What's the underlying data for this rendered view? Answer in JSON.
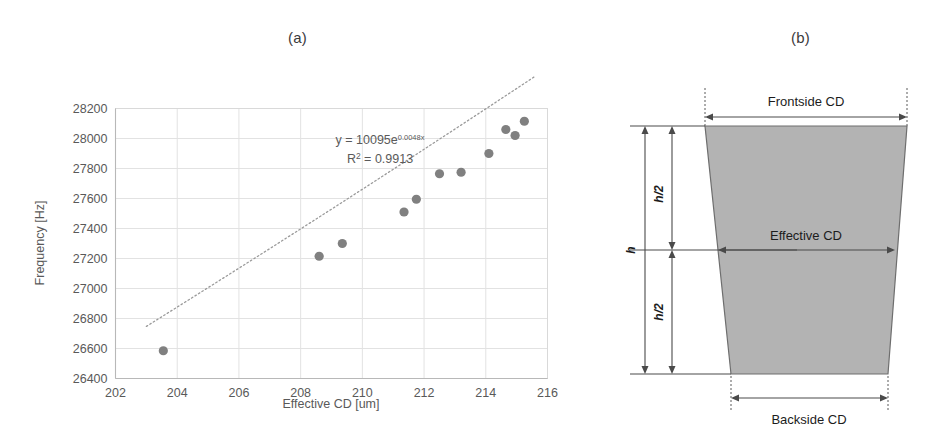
{
  "figure": {
    "panel_a_label": "(a)",
    "panel_b_label": "(b)"
  },
  "chart_data": {
    "type": "scatter",
    "title": "",
    "xlabel": "Effective CD [um]",
    "ylabel": "Frequency [Hz]",
    "xlim": [
      202,
      216
    ],
    "ylim": [
      26400,
      28200
    ],
    "xticks": [
      202,
      204,
      206,
      208,
      210,
      212,
      214,
      216
    ],
    "yticks": [
      26400,
      26600,
      26800,
      27000,
      27200,
      27400,
      27600,
      27800,
      28000,
      28200
    ],
    "grid": true,
    "legend": "none",
    "marker_color": "#808080",
    "trendline": {
      "type": "exponential",
      "style": "dotted",
      "color": "#9a9a9a",
      "equation": "y = 10095e",
      "equation_exponent": "0.0048x",
      "r_squared_label": "R",
      "r_squared_sup": "2",
      "r_squared_value": " = 0.9913"
    },
    "x": [
      203.55,
      208.6,
      209.35,
      211.35,
      211.75,
      212.5,
      213.2,
      214.1,
      214.65,
      214.95,
      215.25
    ],
    "y": [
      26585,
      27215,
      27300,
      27510,
      27595,
      27765,
      27775,
      27900,
      28060,
      28020,
      28115
    ],
    "points": [
      {
        "x": 203.55,
        "y": 26585
      },
      {
        "x": 208.6,
        "y": 27215
      },
      {
        "x": 209.35,
        "y": 27300
      },
      {
        "x": 211.35,
        "y": 27510
      },
      {
        "x": 211.75,
        "y": 27595
      },
      {
        "x": 212.5,
        "y": 27765
      },
      {
        "x": 213.2,
        "y": 27775
      },
      {
        "x": 214.1,
        "y": 27900
      },
      {
        "x": 214.65,
        "y": 28060
      },
      {
        "x": 214.95,
        "y": 28020
      },
      {
        "x": 215.25,
        "y": 28115
      }
    ]
  },
  "diagram": {
    "frontside_label": "Frontside CD",
    "effective_label": "Effective CD",
    "backside_label": "Backside CD",
    "height_label": "h",
    "half_height_label_top": "h/2",
    "half_height_label_bottom": "h/2",
    "shape_fill": "#b3b3b3",
    "shape_stroke": "#6e6e6e"
  }
}
